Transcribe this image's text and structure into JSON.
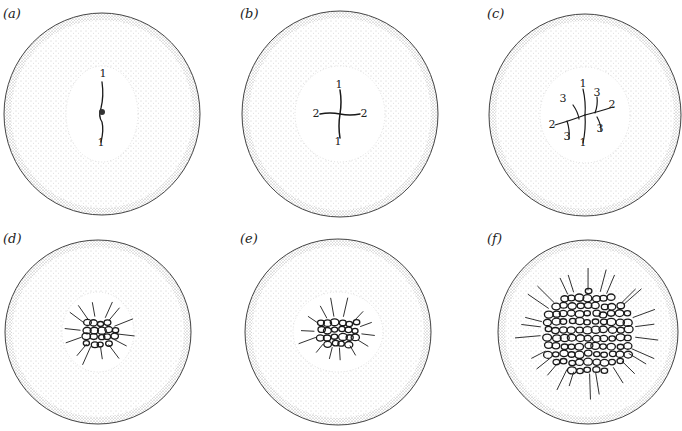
{
  "figure": {
    "panels": [
      {
        "id": "a",
        "label": "(a)",
        "label_pos": [
          3,
          19
        ],
        "cx": 102,
        "cy": 114,
        "rx": 98,
        "ry": 101,
        "clear_r": [
          36,
          48
        ],
        "pattern": "diarch-early",
        "numbers": [
          {
            "t": "1",
            "x": 103,
            "y": 77
          },
          {
            "t": "1",
            "x": 101,
            "y": 146
          }
        ]
      },
      {
        "id": "b",
        "label": "(b)",
        "label_pos": [
          240,
          19
        ],
        "cx": 340,
        "cy": 114,
        "rx": 98,
        "ry": 103,
        "clear_r": [
          45,
          48
        ],
        "pattern": "tetrarch-cross",
        "numbers": [
          {
            "t": "1",
            "x": 339,
            "y": 88
          },
          {
            "t": "1",
            "x": 338,
            "y": 145
          },
          {
            "t": "2",
            "x": 316,
            "y": 117
          },
          {
            "t": "2",
            "x": 364,
            "y": 117
          }
        ]
      },
      {
        "id": "c",
        "label": "(c)",
        "label_pos": [
          487,
          19
        ],
        "cx": 585,
        "cy": 115,
        "rx": 96,
        "ry": 101,
        "clear_r": [
          45,
          48
        ],
        "pattern": "polyarch-branching",
        "numbers": [
          {
            "t": "1",
            "x": 583,
            "y": 87
          },
          {
            "t": "1",
            "x": 583,
            "y": 146
          },
          {
            "t": "2",
            "x": 612,
            "y": 108
          },
          {
            "t": "2",
            "x": 552,
            "y": 128
          },
          {
            "t": "3",
            "x": 563,
            "y": 102
          },
          {
            "t": "3",
            "x": 597,
            "y": 96
          },
          {
            "t": "3",
            "x": 600,
            "y": 132
          },
          {
            "t": "3",
            "x": 567,
            "y": 140
          }
        ]
      },
      {
        "id": "d",
        "label": "(d)",
        "label_pos": [
          3,
          244
        ],
        "cx": 98,
        "cy": 332,
        "rx": 93,
        "ry": 92,
        "clear_r": [
          36,
          40
        ],
        "pattern": "small-stele",
        "numbers": []
      },
      {
        "id": "e",
        "label": "(e)",
        "label_pos": [
          240,
          244
        ],
        "cx": 338,
        "cy": 332,
        "rx": 93,
        "ry": 93,
        "clear_r": [
          45,
          40
        ],
        "pattern": "medium-stele",
        "numbers": []
      },
      {
        "id": "f",
        "label": "(f)",
        "label_pos": [
          487,
          244
        ],
        "cx": 588,
        "cy": 332,
        "rx": 90,
        "ry": 92,
        "clear_r": [
          0,
          0
        ],
        "pattern": "large-reticulate-stele",
        "numbers": []
      }
    ],
    "colors": {
      "outline": "#444444",
      "stipple": "#9a9a9a",
      "vascular": "#1a1a1a",
      "background": "#ffffff"
    }
  }
}
